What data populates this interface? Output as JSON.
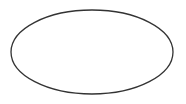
{
  "canvas": {
    "width": 186,
    "height": 104,
    "background": "#ffffff"
  },
  "shapes": [
    {
      "type": "ellipse",
      "cx": 92,
      "cy": 52,
      "rx": 81,
      "ry": 42,
      "stroke": "#333333",
      "stroke_width": 1.3,
      "fill": "none"
    }
  ]
}
